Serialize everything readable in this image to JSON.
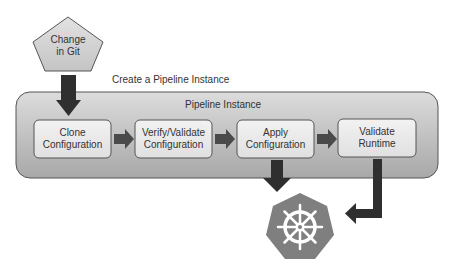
{
  "diagram": {
    "trigger": {
      "label_line1": "Change",
      "label_line2": "in Git",
      "shape": "pentagon"
    },
    "create_label": "Create a Pipeline Instance",
    "container": {
      "title": "Pipeline Instance"
    },
    "steps": [
      {
        "line1": "Clone",
        "line2": "Configuration"
      },
      {
        "line1": "Verify/Validate",
        "line2": "Configuration"
      },
      {
        "line1": "Apply",
        "line2": "Configuration"
      },
      {
        "line1": "Validate",
        "line2": "Runtime"
      }
    ],
    "target": {
      "icon": "kubernetes-helm-icon",
      "shape": "heptagon"
    },
    "colors": {
      "container_fill_top": "#d8d8d8",
      "container_fill_bottom": "#a9a9a9",
      "step_fill": "#ececec",
      "arrow": "#333333",
      "step_arrow": "#4a4a4a",
      "k8s_fill": "#7f7f7f",
      "pentagon_fill": "#d4d4d4"
    }
  }
}
